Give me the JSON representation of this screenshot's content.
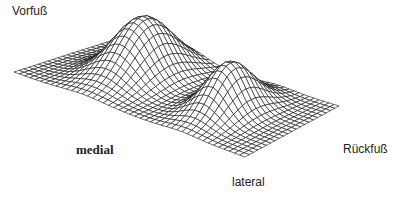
{
  "chart_data": {
    "type": "surface3d",
    "title": "",
    "labels": {
      "forefoot": "Vorfuß",
      "rearfoot": "Rückfuß",
      "medial": "medial",
      "lateral": "lateral"
    },
    "grid": {
      "rows": 22,
      "cols": 44
    },
    "base_corners": {
      "left": [
        14,
        72
      ],
      "back": [
        120,
        38
      ],
      "right": [
        339,
        106
      ],
      "front": [
        245,
        157
      ]
    },
    "peaks": [
      {
        "name": "forefoot",
        "u": 0.3,
        "v": 0.42,
        "height": 58,
        "spread_u": 0.09,
        "spread_v": 0.24
      },
      {
        "name": "rearfoot",
        "u": 0.72,
        "v": 0.5,
        "height": 48,
        "spread_u": 0.07,
        "spread_v": 0.2
      }
    ],
    "line_color": "#111111"
  },
  "labels": {
    "forefoot": "Vorfuß",
    "rearfoot": "Rückfuß",
    "medial": "medial",
    "lateral": "lateral"
  }
}
